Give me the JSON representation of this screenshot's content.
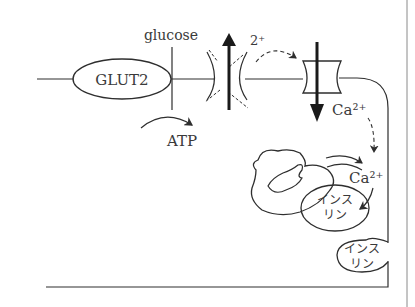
{
  "diagram": {
    "type": "cell-signaling-schematic",
    "labels": {
      "glucose": "glucose",
      "transporter": "GLUT2",
      "atp": "ATP",
      "ion_top": "2⁺",
      "calcium_out": "Ca²⁺",
      "calcium_in": "Ca²⁺",
      "insulin_granule_1_line1": "インス",
      "insulin_granule_1_line2": "リン",
      "insulin_granule_2_line1": "インス",
      "insulin_granule_2_line2": "リン"
    },
    "elements": [
      "cell-membrane",
      "glut2-transporter",
      "atp-arrow",
      "potassium-channel-closed",
      "calcium-channel",
      "calcium-influx-arrow",
      "golgi-apparatus",
      "insulin-granule-internal",
      "insulin-granule-exocytosis",
      "right-margin-line"
    ],
    "colors": {
      "ink": "#2e2e2e",
      "text": "#3a3a3a",
      "background": "#ffffff"
    }
  }
}
